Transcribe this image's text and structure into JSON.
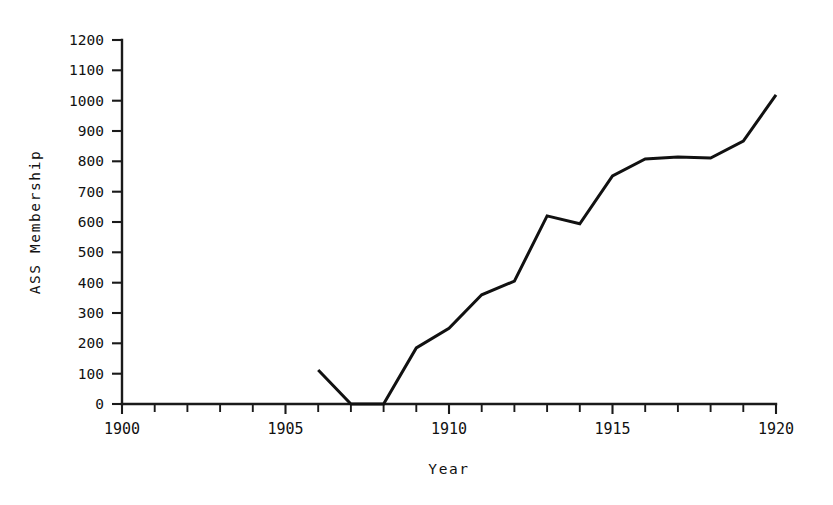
{
  "chart_data": {
    "type": "line",
    "title": "",
    "xlabel": "Year",
    "ylabel": "ASS Membership",
    "xlim": [
      1900,
      1920
    ],
    "ylim": [
      0,
      1200
    ],
    "grid": false,
    "legend": null,
    "x_tick_labels": [
      "1900",
      "1905",
      "1910",
      "1915",
      "1920"
    ],
    "x_tick_values": [
      1900,
      1905,
      1910,
      1915,
      1920
    ],
    "x_minor_ticks": [
      1901,
      1902,
      1903,
      1904,
      1906,
      1907,
      1908,
      1909,
      1911,
      1912,
      1913,
      1914,
      1916,
      1917,
      1918,
      1919
    ],
    "y_tick_labels": [
      "0",
      "100",
      "200",
      "300",
      "400",
      "500",
      "600",
      "700",
      "800",
      "900",
      "1000",
      "1100",
      "1200"
    ],
    "y_tick_values": [
      0,
      100,
      200,
      300,
      400,
      500,
      600,
      700,
      800,
      900,
      1000,
      1100,
      1200
    ],
    "x": [
      1906,
      1907,
      1908,
      1909,
      1910,
      1911,
      1912,
      1913,
      1914,
      1915,
      1916,
      1917,
      1918,
      1919,
      1920
    ],
    "values": [
      112,
      0,
      0,
      185,
      250,
      360,
      405,
      620,
      594,
      752,
      808,
      814,
      811,
      867,
      1019
    ],
    "series": [
      {
        "name": "ASS Membership",
        "color": "#111111",
        "x": [
          1906,
          1907,
          1908,
          1909,
          1910,
          1911,
          1912,
          1913,
          1914,
          1915,
          1916,
          1917,
          1918,
          1919,
          1920
        ],
        "values": [
          112,
          0,
          0,
          185,
          250,
          360,
          405,
          620,
          594,
          752,
          808,
          814,
          811,
          867,
          1019
        ]
      }
    ]
  },
  "figure": {
    "background_color": "#ffffff",
    "line_color": "#111111",
    "axis_color": "#1a1a1a"
  }
}
